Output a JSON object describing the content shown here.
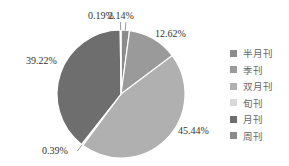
{
  "chart_data": {
    "type": "pie",
    "title": "",
    "categories": [
      "半月刊",
      "季刊",
      "双月刊",
      "旬刊",
      "月刊",
      "周刊"
    ],
    "values": [
      2.14,
      12.62,
      45.44,
      0.39,
      39.22,
      0.19
    ],
    "labels": [
      "2.14%",
      "12.62%",
      "45.44%",
      "0.39%",
      "39.22%",
      "0.19%"
    ],
    "colors": [
      "#8c8c8c",
      "#9a9a9a",
      "#b0b0b0",
      "#d8d8d8",
      "#6e6e6e",
      "#8a8a8a"
    ],
    "start_angle": "12 o'clock, clockwise",
    "legend_position": "right"
  },
  "legend": {
    "items": [
      {
        "label": "半月刊",
        "color": "#8c8c8c"
      },
      {
        "label": "季刊",
        "color": "#9a9a9a"
      },
      {
        "label": "双月刊",
        "color": "#b0b0b0"
      },
      {
        "label": "旬刊",
        "color": "#d8d8d8"
      },
      {
        "label": "月刊",
        "color": "#6e6e6e"
      },
      {
        "label": "周刊",
        "color": "#8a8a8a"
      }
    ]
  }
}
